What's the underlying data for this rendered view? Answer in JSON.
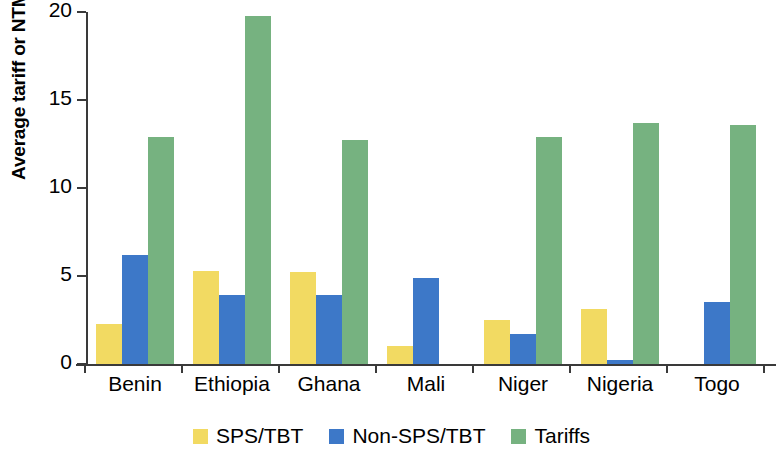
{
  "chart_data": {
    "type": "bar",
    "title": "",
    "xlabel": "",
    "ylabel": "Average tariff or NTM AVE (%)",
    "ylim": [
      0,
      20
    ],
    "yticks": [
      0,
      5,
      10,
      15,
      20
    ],
    "ytick_labels": [
      "0",
      "5",
      "10",
      "15",
      "20"
    ],
    "grid": false,
    "legend_position": "bottom",
    "categories": [
      "Benin",
      "Ethiopia",
      "Ghana",
      "Mali",
      "Niger",
      "Nigeria",
      "Togo"
    ],
    "series": [
      {
        "name": "SPS/TBT",
        "color": "#f2da62",
        "values": [
          2.3,
          5.3,
          5.2,
          1.0,
          2.5,
          3.1,
          null
        ]
      },
      {
        "name": "Non-SPS/TBT",
        "color": "#3d78c8",
        "values": [
          6.2,
          3.9,
          3.9,
          4.9,
          1.7,
          0.2,
          3.5
        ]
      },
      {
        "name": "Tariffs",
        "color": "#76b280",
        "values": [
          12.9,
          19.8,
          12.7,
          null,
          12.9,
          13.7,
          13.6
        ]
      }
    ]
  },
  "legend": {
    "items": [
      {
        "label": "SPS/TBT",
        "color": "#f2da62"
      },
      {
        "label": "Non-SPS/TBT",
        "color": "#3d78c8"
      },
      {
        "label": "Tariffs",
        "color": "#76b280"
      }
    ]
  },
  "axis": {
    "y_title": "Average tariff or NTM AVE (%)"
  }
}
